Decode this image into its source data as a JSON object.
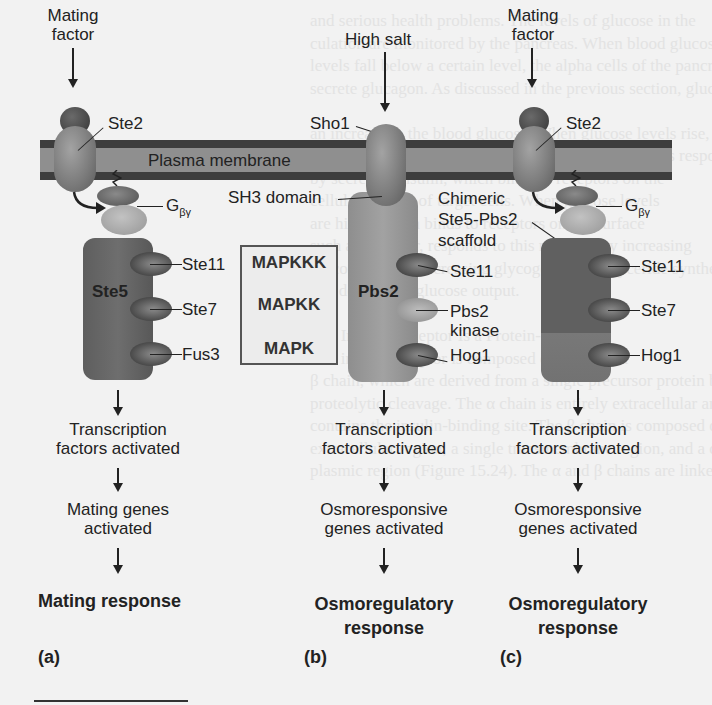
{
  "figure": {
    "membrane_label": "Plasma membrane",
    "mapk_legend": [
      "MAPKKK",
      "MAPKK",
      "MAPK"
    ],
    "panels": [
      {
        "id": "a",
        "panel_label": "(a)",
        "stimulus": [
          "Mating",
          "factor"
        ],
        "receptor": "Ste2",
        "g_protein": {
          "base": "G",
          "subscript": "βγ"
        },
        "scaffold": "Ste5",
        "kinases": [
          "Ste11",
          "Ste7",
          "Fus3"
        ],
        "step1": [
          "Transcription",
          "factors activated"
        ],
        "step2": [
          "Mating genes",
          "activated"
        ],
        "response": [
          "Mating response"
        ]
      },
      {
        "id": "b",
        "panel_label": "(b)",
        "stimulus": [
          "High salt"
        ],
        "receptor": "Sho1",
        "domain_label": "SH3 domain",
        "scaffold": "Pbs2",
        "kinases": [
          "Ste11",
          "Pbs2",
          "kinase",
          "Hog1"
        ],
        "step1": [
          "Transcription",
          "factors activated"
        ],
        "step2": [
          "Osmoresponsive",
          "genes activated"
        ],
        "response": [
          "Osmoregulatory",
          "response"
        ]
      },
      {
        "id": "c",
        "panel_label": "(c)",
        "stimulus": [
          "Mating",
          "factor"
        ],
        "receptor": "Ste2",
        "g_protein": {
          "base": "G",
          "subscript": "βγ"
        },
        "scaffold_label": [
          "Chimeric",
          "Ste5-Pbs2",
          "scaffold"
        ],
        "kinases": [
          "Ste11",
          "Ste7",
          "Hog1"
        ],
        "step1": [
          "Transcription",
          "factors activated"
        ],
        "step2": [
          "Osmoresponsive",
          "genes activated"
        ],
        "response": [
          "Osmoregulatory",
          "response"
        ]
      }
    ]
  },
  "background_text": [
    "and serious health problems. The levels of glucose in the",
    "culation are monitored by the pancreas. When blood glucose",
    "levels fall below a certain level, the alpha cells of the pancreas",
    "secrete glucagon. As discussed in the previous section, glucagon",
    "",
    "an increase in the blood glucose. When glucose levels rise, as",
    "occurs after eating a carbohydrate meal, the beta cells respond",
    "by secreting insulin, which binds to receptors on the",
    "cellular surface of target cells. When glucose levels",
    "are high, insulin binds to receptors on the surface",
    "such as the liver, responds to this message by increasing",
    "glucose uptake, increasing glycogen and triglyceride synthesis,",
    "and decreasing glucose output.",
    "",
    "The Insulin Receptor Is a Protein-Tyrosine",
    "The insulin receptor is composed of an α and a",
    "β chain, which are derived from a single precursor protein by",
    "proteolytic cleavage. The α chain is entirely extracellular and",
    "contains the insulin-binding site. The β chain is composed of an",
    "extracellular region, a single transmembrane region, and a cyto-",
    "plasmic region (Figure 15.24). The α and β chains are linked"
  ]
}
